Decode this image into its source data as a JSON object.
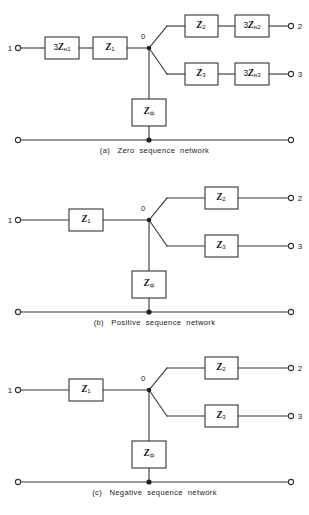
{
  "page": {
    "background": "#ffffff",
    "line_color": "#333333",
    "box_fill": "#ffffff",
    "box_border": "#333333"
  },
  "figures": [
    {
      "id": "a",
      "caption": "(a)   Zero  sequence  network",
      "node_label": "0",
      "terminals": {
        "input": "1",
        "output_top": "2",
        "output_bottom": "3"
      },
      "boxes": {
        "series_1": {
          "prefix": "3",
          "symbol": "Z",
          "sub": "н1"
        },
        "series_2": {
          "prefix": "",
          "symbol": "Z",
          "sub": "1"
        },
        "branch_top_1": {
          "prefix": "",
          "symbol": "Z",
          "sub": "2"
        },
        "branch_top_2": {
          "prefix": "3",
          "symbol": "Z",
          "sub": "н2"
        },
        "branch_bottom_1": {
          "prefix": "",
          "symbol": "Z",
          "sub": "3"
        },
        "branch_bottom_2": {
          "prefix": "3",
          "symbol": "Z",
          "sub": "н3"
        },
        "shunt": {
          "prefix": "",
          "symbol": "Z",
          "sub": "ф"
        }
      }
    },
    {
      "id": "b",
      "caption": "(b)   Positive  sequence  network",
      "node_label": "0",
      "terminals": {
        "input": "1",
        "output_top": "2",
        "output_bottom": "3"
      },
      "boxes": {
        "series_1": {
          "prefix": "",
          "symbol": "Z",
          "sub": "1"
        },
        "branch_top_1": {
          "prefix": "",
          "symbol": "Z",
          "sub": "2"
        },
        "branch_bottom_1": {
          "prefix": "",
          "symbol": "Z",
          "sub": "3"
        },
        "shunt": {
          "prefix": "",
          "symbol": "Z",
          "sub": "ф"
        }
      }
    },
    {
      "id": "c",
      "caption": "(c)   Negative  sequence  network",
      "node_label": "0",
      "terminals": {
        "input": "1",
        "output_top": "2",
        "output_bottom": "3"
      },
      "boxes": {
        "series_1": {
          "prefix": "",
          "symbol": "Z",
          "sub": "1"
        },
        "branch_top_1": {
          "prefix": "",
          "symbol": "Z",
          "sub": "2"
        },
        "branch_bottom_1": {
          "prefix": "",
          "symbol": "Z",
          "sub": "3"
        },
        "shunt": {
          "prefix": "",
          "symbol": "Z",
          "sub": "ф"
        }
      }
    }
  ]
}
